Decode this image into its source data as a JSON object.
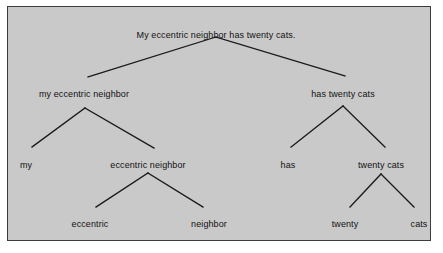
{
  "figure": {
    "kind": "syntax-tree-diagram",
    "background_color": "#c9c9c9",
    "page_color": "#ffffff",
    "border_color": "#3c3c3c",
    "line_color": "#1a1a1a",
    "text_color": "#121212"
  },
  "tree": {
    "sentence": "My eccentric neighbor has twenty cats.",
    "nodes": [
      {
        "id": "root",
        "label": "My eccentric neighbor has twenty cats.",
        "x": 216,
        "y": 30,
        "apex_x": 216,
        "apex_y": 37
      },
      {
        "id": "np",
        "label": "my eccentric neighbor",
        "x": 84,
        "y": 89,
        "apex_x": 85,
        "apex_y": 108
      },
      {
        "id": "vp",
        "label": "has twenty cats",
        "x": 343,
        "y": 89,
        "apex_x": 343,
        "apex_y": 106
      },
      {
        "id": "det",
        "label": "my",
        "x": 26,
        "y": 160,
        "apex_x": 32,
        "apex_y": 147
      },
      {
        "id": "nom",
        "label": "eccentric neighbor",
        "x": 148,
        "y": 160,
        "apex_x": 148,
        "apex_y": 173
      },
      {
        "id": "verb",
        "label": "has",
        "x": 288,
        "y": 160,
        "apex_x": 291,
        "apex_y": 147
      },
      {
        "id": "object-np",
        "label": "twenty cats",
        "x": 381,
        "y": 160,
        "apex_x": 381,
        "apex_y": 174
      },
      {
        "id": "adj",
        "label": "eccentric",
        "x": 90,
        "y": 219,
        "apex_x": 96,
        "apex_y": 207
      },
      {
        "id": "noun",
        "label": "neighbor",
        "x": 209,
        "y": 219,
        "apex_x": 203,
        "apex_y": 207
      },
      {
        "id": "numeral",
        "label": "twenty",
        "x": 345,
        "y": 219,
        "apex_x": 350,
        "apex_y": 207
      },
      {
        "id": "plural-noun",
        "label": "cats",
        "x": 419,
        "y": 219,
        "apex_x": 414,
        "apex_y": 207
      }
    ],
    "branches": [
      {
        "from": "root",
        "to": "np",
        "x1": 216,
        "y1": 37,
        "x2": 88,
        "y2": 77
      },
      {
        "from": "root",
        "to": "vp",
        "x1": 216,
        "y1": 37,
        "x2": 345,
        "y2": 76
      },
      {
        "from": "np",
        "to": "det",
        "x1": 85,
        "y1": 108,
        "x2": 32,
        "y2": 147
      },
      {
        "from": "np",
        "to": "nom",
        "x1": 85,
        "y1": 108,
        "x2": 154,
        "y2": 148
      },
      {
        "from": "vp",
        "to": "verb",
        "x1": 343,
        "y1": 106,
        "x2": 291,
        "y2": 147
      },
      {
        "from": "vp",
        "to": "object-np",
        "x1": 343,
        "y1": 106,
        "x2": 385,
        "y2": 147
      },
      {
        "from": "nom",
        "to": "adj",
        "x1": 148,
        "y1": 173,
        "x2": 96,
        "y2": 207
      },
      {
        "from": "nom",
        "to": "noun",
        "x1": 148,
        "y1": 173,
        "x2": 203,
        "y2": 207
      },
      {
        "from": "object-np",
        "to": "numeral",
        "x1": 381,
        "y1": 174,
        "x2": 350,
        "y2": 207
      },
      {
        "from": "object-np",
        "to": "plural-noun",
        "x1": 381,
        "y1": 174,
        "x2": 414,
        "y2": 207
      }
    ]
  }
}
